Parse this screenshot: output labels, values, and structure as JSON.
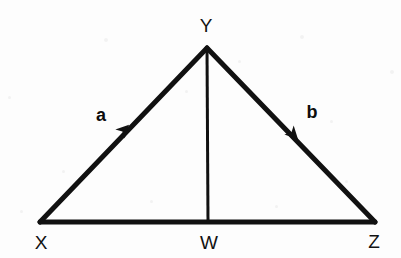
{
  "figure": {
    "background_color": "#fdfdfd",
    "stroke_color": "#111111",
    "width": 401,
    "height": 258
  },
  "points": {
    "X": {
      "label": "X",
      "x": 40,
      "y": 222,
      "label_x": 41,
      "label_y": 242
    },
    "Y": {
      "label": "Y",
      "x": 207,
      "y": 48,
      "label_x": 206,
      "label_y": 25
    },
    "Z": {
      "label": "Z",
      "x": 375,
      "y": 222,
      "label_x": 374,
      "label_y": 241
    },
    "W": {
      "label": "W",
      "x": 208,
      "y": 222,
      "label_x": 209,
      "label_y": 242
    }
  },
  "segments": [
    {
      "name": "base-xz",
      "from": "X",
      "to": "Z",
      "stroke_width": 5,
      "arrow": false
    },
    {
      "name": "side-xy",
      "from": "X",
      "to": "Y",
      "stroke_width": 5,
      "arrow": true
    },
    {
      "name": "side-yz",
      "from": "Y",
      "to": "Z",
      "stroke_width": 5,
      "arrow": true
    },
    {
      "name": "median-yw",
      "from": "Y",
      "to": "W",
      "stroke_width": 3,
      "arrow": false
    }
  ],
  "vectors": [
    {
      "name": "a",
      "label": "a",
      "label_x": 101,
      "label_y": 115,
      "arrow_x": 120,
      "arrow_y": 134,
      "direction_deg": -46,
      "from": "X",
      "to": "Y"
    },
    {
      "name": "b",
      "label": "b",
      "label_x": 312,
      "label_y": 112,
      "arrow_x": 289,
      "arrow_y": 130,
      "direction_deg": 46,
      "from": "Y",
      "to": "Z"
    }
  ],
  "speckles": [
    {
      "x": 8,
      "y": 96,
      "size": 3
    },
    {
      "x": 104,
      "y": 38,
      "size": 4
    },
    {
      "x": 150,
      "y": 200,
      "size": 3
    },
    {
      "x": 238,
      "y": 60,
      "size": 3
    },
    {
      "x": 300,
      "y": 35,
      "size": 4
    },
    {
      "x": 345,
      "y": 180,
      "size": 3
    },
    {
      "x": 62,
      "y": 170,
      "size": 3
    },
    {
      "x": 275,
      "y": 205,
      "size": 3
    },
    {
      "x": 330,
      "y": 120,
      "size": 3
    },
    {
      "x": 185,
      "y": 90,
      "size": 3
    },
    {
      "x": 390,
      "y": 70,
      "size": 4
    },
    {
      "x": 20,
      "y": 210,
      "size": 3
    }
  ]
}
